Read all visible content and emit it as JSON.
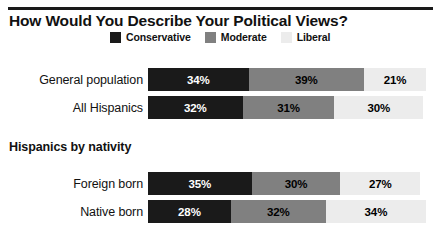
{
  "title": "How Would You Describe Your Political Views?",
  "legend": {
    "position": "top-center",
    "items": [
      {
        "label": "Conservative",
        "color": "#1a1a1a",
        "icon": "legend-swatch-icon"
      },
      {
        "label": "Moderate",
        "color": "#808080",
        "icon": "legend-swatch-icon"
      },
      {
        "label": "Liberal",
        "color": "#ececec",
        "icon": "legend-swatch-icon"
      }
    ]
  },
  "section_header": "Hispanics by nativity",
  "rows": [
    {
      "label": "General population",
      "values": [
        {
          "label": "34%",
          "value": 34,
          "series": "Conservative"
        },
        {
          "label": "39%",
          "value": 39,
          "series": "Moderate"
        },
        {
          "label": "21%",
          "value": 21,
          "series": "Liberal"
        }
      ]
    },
    {
      "label": "All Hispanics",
      "values": [
        {
          "label": "32%",
          "value": 32,
          "series": "Conservative"
        },
        {
          "label": "31%",
          "value": 31,
          "series": "Moderate"
        },
        {
          "label": "30%",
          "value": 30,
          "series": "Liberal"
        }
      ]
    },
    {
      "label": "Foreign born",
      "values": [
        {
          "label": "35%",
          "value": 35,
          "series": "Conservative"
        },
        {
          "label": "30%",
          "value": 30,
          "series": "Moderate"
        },
        {
          "label": "27%",
          "value": 27,
          "series": "Liberal"
        }
      ]
    },
    {
      "label": "Native born",
      "values": [
        {
          "label": "28%",
          "value": 28,
          "series": "Conservative"
        },
        {
          "label": "32%",
          "value": 32,
          "series": "Moderate"
        },
        {
          "label": "34%",
          "value": 34,
          "series": "Liberal"
        }
      ]
    }
  ],
  "chart_data": {
    "type": "bar",
    "orientation": "horizontal",
    "stacked": true,
    "title": "How Would You Describe Your Political Views?",
    "subtitle": "",
    "xlabel": "",
    "ylabel": "",
    "xlim": [
      0,
      100
    ],
    "grid": false,
    "legend_position": "top-center",
    "categories": [
      "General population",
      "All Hispanics",
      "Foreign born",
      "Native born"
    ],
    "category_groups": [
      {
        "header": "",
        "categories": [
          "General population",
          "All Hispanics"
        ]
      },
      {
        "header": "Hispanics by nativity",
        "categories": [
          "Foreign born",
          "Native born"
        ]
      }
    ],
    "series": [
      {
        "name": "Conservative",
        "color": "#1a1a1a",
        "values": [
          34,
          39,
          35,
          28
        ]
      },
      {
        "name": "Moderate",
        "color": "#808080",
        "values": [
          39,
          31,
          30,
          32
        ]
      },
      {
        "name": "Liberal",
        "color": "#ececec",
        "values": [
          21,
          30,
          27,
          34
        ]
      }
    ],
    "series_corrected": [
      {
        "name": "Conservative",
        "color": "#1a1a1a",
        "values": [
          34,
          32,
          35,
          28
        ]
      },
      {
        "name": "Moderate",
        "color": "#808080",
        "values": [
          39,
          31,
          30,
          32
        ]
      },
      {
        "name": "Liberal",
        "color": "#ececec",
        "values": [
          21,
          30,
          27,
          34
        ]
      }
    ],
    "value_labels": [
      [
        "34%",
        "39%",
        "21%"
      ],
      [
        "32%",
        "31%",
        "30%"
      ],
      [
        "35%",
        "30%",
        "27%"
      ],
      [
        "28%",
        "32%",
        "34%"
      ]
    ],
    "units": "percent",
    "annotations": []
  },
  "layout": {
    "bar_start_x": 148,
    "px_per_percent": 2.96,
    "bar_height": 23,
    "row_tops": [
      68,
      96,
      172,
      200
    ],
    "section_header_top": 140
  }
}
